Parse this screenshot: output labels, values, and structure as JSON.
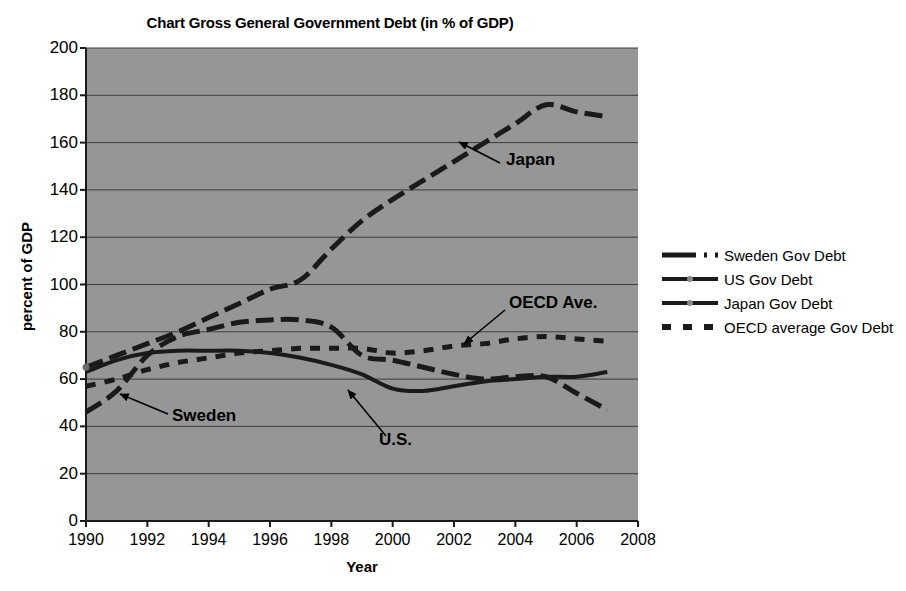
{
  "chart_data": {
    "type": "line",
    "title": "Chart Gross General Government Debt (in % of GDP)",
    "xlabel": "Year",
    "ylabel": "percent of GDP",
    "xlim": [
      1990,
      2008
    ],
    "ylim": [
      0,
      200
    ],
    "xticks": [
      1990,
      1992,
      1994,
      1996,
      1998,
      2000,
      2002,
      2004,
      2006,
      2008
    ],
    "yticks": [
      0,
      20,
      40,
      60,
      80,
      100,
      120,
      140,
      160,
      180,
      200
    ],
    "grid": "horizontal",
    "legend_position": "right",
    "plot_background": "#969696",
    "line_color": "#1a1a1a",
    "x": [
      1990,
      1991,
      1992,
      1993,
      1994,
      1995,
      1996,
      1997,
      1998,
      1999,
      2000,
      2001,
      2002,
      2003,
      2004,
      2005,
      2006,
      2007
    ],
    "series": [
      {
        "name": "Sweden Gov Debt",
        "style": "long-dash",
        "values": [
          46,
          55,
          70,
          78,
          81,
          84,
          85,
          85,
          82,
          70,
          68,
          65,
          62,
          60,
          61,
          61,
          54,
          47
        ]
      },
      {
        "name": "US Gov Debt",
        "style": "solid",
        "values": [
          63,
          68,
          71,
          72,
          72,
          72,
          71,
          69,
          66,
          62,
          56,
          55,
          57,
          59,
          60,
          61,
          61,
          63
        ]
      },
      {
        "name": "Japan Gov Debt",
        "style": "long-dash",
        "values": [
          65,
          70,
          75,
          80,
          86,
          92,
          98,
          102,
          115,
          127,
          136,
          144,
          152,
          160,
          168,
          176,
          173,
          171
        ]
      },
      {
        "name": "OECD average Gov Debt",
        "style": "short-dash",
        "values": [
          57,
          60,
          64,
          67,
          69,
          71,
          72,
          73,
          73,
          73,
          71,
          72,
          74,
          75,
          77,
          78,
          77,
          76
        ]
      }
    ],
    "annotations": [
      {
        "text": "Japan",
        "label_x": 506,
        "label_y": 162,
        "arrow_from_x": 500,
        "arrow_from_y": 163,
        "arrow_to_x": 459,
        "arrow_to_y": 142
      },
      {
        "text": "OECD Ave.",
        "label_x": 509,
        "label_y": 305,
        "arrow_from_x": 505,
        "arrow_from_y": 310,
        "arrow_to_x": 464,
        "arrow_to_y": 344
      },
      {
        "text": "Sweden",
        "label_x": 172,
        "label_y": 418,
        "arrow_from_x": 168,
        "arrow_from_y": 414,
        "arrow_to_x": 120,
        "arrow_to_y": 394
      },
      {
        "text": "U.S.",
        "label_x": 379,
        "label_y": 442,
        "arrow_from_x": 386,
        "arrow_from_y": 436,
        "arrow_to_x": 348,
        "arrow_to_y": 390
      }
    ]
  },
  "legend": {
    "items": [
      {
        "label": "Sweden Gov Debt",
        "marker": "dash-dot-line-marker"
      },
      {
        "label": "US Gov Debt",
        "marker": "solid-line-marker"
      },
      {
        "label": "Japan Gov Debt",
        "marker": "solid-line-marker"
      },
      {
        "label": "OECD average Gov Debt",
        "marker": "square-dash-marker"
      }
    ]
  }
}
